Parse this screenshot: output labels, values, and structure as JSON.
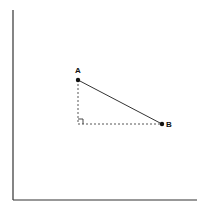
{
  "diagram": {
    "title": "",
    "axes": {
      "x_axis": "horizontal axis",
      "y_axis": "vertical axis"
    },
    "points": [
      {
        "label": "A",
        "x": 78,
        "y": 80
      },
      {
        "label": "B",
        "x": 162,
        "y": 124
      }
    ],
    "right_angle_corner": {
      "x": 78,
      "y": 124
    },
    "colors": {
      "line": "#333333",
      "point": "#111111",
      "axis": "#333333",
      "dashed": "#444444"
    }
  }
}
